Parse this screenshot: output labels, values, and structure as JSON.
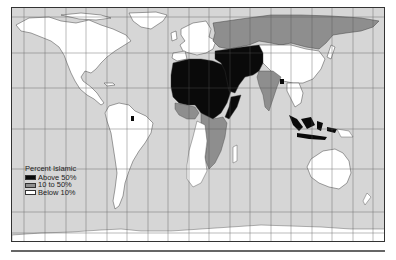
{
  "map": {
    "title": "Percent Islamic",
    "type": "world choropleth",
    "colors": {
      "ocean": "#d6d6d6",
      "above_50": "#0a0a0a",
      "10_to_50": "#8e8e8e",
      "below_10": "#ffffff",
      "grid": "#555555",
      "border": "#333333"
    },
    "legend": {
      "title": "Percent Islamic",
      "items": [
        {
          "label": "Above 50%",
          "color": "#0a0a0a"
        },
        {
          "label": "10 to 50%",
          "color": "#8e8e8e"
        },
        {
          "label": "Below 10%",
          "color": "#ffffff"
        }
      ]
    },
    "regions": {
      "above_50": [
        "North Africa",
        "Sahel",
        "Middle East",
        "Arabian Peninsula",
        "Iran",
        "Central Asia",
        "Pakistan",
        "Afghanistan",
        "Bangladesh",
        "Indonesia",
        "Malaysia",
        "Somalia",
        "Suriname"
      ],
      "10_to_50": [
        "Russia",
        "West Africa coast",
        "Ethiopia",
        "Tanzania",
        "Mozambique",
        "India",
        "Kazakhstan",
        "Nigeria"
      ],
      "below_10": [
        "North America",
        "South America",
        "Europe",
        "China",
        "Southern Africa",
        "Australia",
        "Antarctica"
      ]
    }
  }
}
